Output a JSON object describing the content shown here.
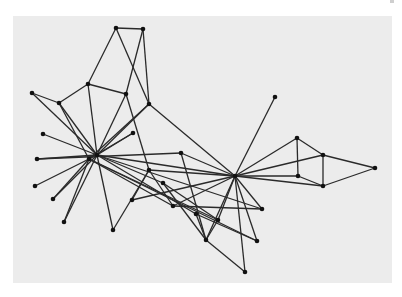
{
  "figure": {
    "type": "network-graph",
    "background_color": "#ececec",
    "edge_color": "#2a2a2a",
    "node_color": "#111111"
  },
  "nodes": [
    {
      "id": "A",
      "x": 116,
      "y": 28
    },
    {
      "id": "B",
      "x": 143,
      "y": 29
    },
    {
      "id": "C",
      "x": 88,
      "y": 84
    },
    {
      "id": "D",
      "x": 126,
      "y": 94
    },
    {
      "id": "E",
      "x": 149,
      "y": 104
    },
    {
      "id": "F",
      "x": 32,
      "y": 93
    },
    {
      "id": "G",
      "x": 59,
      "y": 103
    },
    {
      "id": "H",
      "x": 275,
      "y": 97
    },
    {
      "id": "I",
      "x": 43,
      "y": 134
    },
    {
      "id": "J",
      "x": 133,
      "y": 133
    },
    {
      "id": "K",
      "x": 97,
      "y": 155
    },
    {
      "id": "L",
      "x": 89,
      "y": 159
    },
    {
      "id": "M",
      "x": 37,
      "y": 159
    },
    {
      "id": "N",
      "x": 181,
      "y": 153
    },
    {
      "id": "O",
      "x": 235,
      "y": 176
    },
    {
      "id": "P",
      "x": 297,
      "y": 138
    },
    {
      "id": "Q",
      "x": 323,
      "y": 155
    },
    {
      "id": "R",
      "x": 375,
      "y": 168
    },
    {
      "id": "S",
      "x": 298,
      "y": 176
    },
    {
      "id": "T",
      "x": 323,
      "y": 186
    },
    {
      "id": "U",
      "x": 35,
      "y": 186
    },
    {
      "id": "V",
      "x": 53,
      "y": 199
    },
    {
      "id": "W",
      "x": 64,
      "y": 222
    },
    {
      "id": "X",
      "x": 113,
      "y": 230
    },
    {
      "id": "Y",
      "x": 149,
      "y": 170
    },
    {
      "id": "Z",
      "x": 163,
      "y": 183
    },
    {
      "id": "AA",
      "x": 132,
      "y": 200
    },
    {
      "id": "AB",
      "x": 173,
      "y": 206
    },
    {
      "id": "AC",
      "x": 196,
      "y": 214
    },
    {
      "id": "AD",
      "x": 262,
      "y": 209
    },
    {
      "id": "AE",
      "x": 218,
      "y": 220
    },
    {
      "id": "AF",
      "x": 206,
      "y": 240
    },
    {
      "id": "AG",
      "x": 257,
      "y": 241
    },
    {
      "id": "AH",
      "x": 245,
      "y": 272
    }
  ],
  "edges": [
    [
      "A",
      "B"
    ],
    [
      "A",
      "C"
    ],
    [
      "A",
      "E"
    ],
    [
      "B",
      "D"
    ],
    [
      "B",
      "E"
    ],
    [
      "C",
      "D"
    ],
    [
      "C",
      "G"
    ],
    [
      "C",
      "K"
    ],
    [
      "D",
      "K"
    ],
    [
      "D",
      "Y"
    ],
    [
      "E",
      "K"
    ],
    [
      "E",
      "L"
    ],
    [
      "E",
      "O"
    ],
    [
      "F",
      "G"
    ],
    [
      "F",
      "K"
    ],
    [
      "G",
      "K"
    ],
    [
      "G",
      "L"
    ],
    [
      "H",
      "O"
    ],
    [
      "I",
      "K"
    ],
    [
      "J",
      "K"
    ],
    [
      "J",
      "L"
    ],
    [
      "M",
      "K"
    ],
    [
      "M",
      "N"
    ],
    [
      "K",
      "U"
    ],
    [
      "K",
      "V"
    ],
    [
      "K",
      "W"
    ],
    [
      "K",
      "X"
    ],
    [
      "K",
      "Z"
    ],
    [
      "K",
      "O"
    ],
    [
      "K",
      "AD"
    ],
    [
      "K",
      "AC"
    ],
    [
      "L",
      "V"
    ],
    [
      "L",
      "W"
    ],
    [
      "L",
      "AB"
    ],
    [
      "L",
      "AG"
    ],
    [
      "L",
      "AE"
    ],
    [
      "N",
      "O"
    ],
    [
      "N",
      "AF"
    ],
    [
      "O",
      "P"
    ],
    [
      "O",
      "Q"
    ],
    [
      "O",
      "S"
    ],
    [
      "O",
      "T"
    ],
    [
      "O",
      "AD"
    ],
    [
      "O",
      "AG"
    ],
    [
      "O",
      "AH"
    ],
    [
      "O",
      "AF"
    ],
    [
      "O",
      "AE"
    ],
    [
      "O",
      "AB"
    ],
    [
      "O",
      "Y"
    ],
    [
      "P",
      "Q"
    ],
    [
      "P",
      "S"
    ],
    [
      "Q",
      "R"
    ],
    [
      "Q",
      "T"
    ],
    [
      "R",
      "T"
    ],
    [
      "S",
      "T"
    ],
    [
      "Y",
      "AA"
    ],
    [
      "Y",
      "AB"
    ],
    [
      "X",
      "Y"
    ],
    [
      "Z",
      "AF"
    ],
    [
      "Z",
      "AE"
    ],
    [
      "AA",
      "O"
    ],
    [
      "AB",
      "AD"
    ],
    [
      "AC",
      "AF"
    ],
    [
      "AC",
      "AG"
    ],
    [
      "AF",
      "AH"
    ],
    [
      "AE",
      "AF"
    ]
  ]
}
